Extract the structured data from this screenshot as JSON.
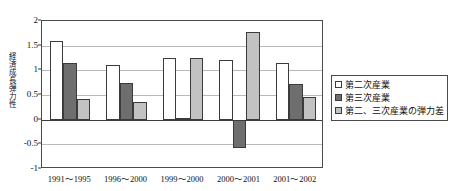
{
  "chart_data": {
    "type": "bar",
    "title": "",
    "xlabel": "",
    "ylabel": "経済成長弾力性",
    "categories": [
      "1991〜1995",
      "1996〜2000",
      "1999〜2000",
      "2000〜2001",
      "2001〜2002"
    ],
    "series": [
      {
        "name": "第二次産業",
        "color": "#ffffff",
        "values": [
          1.6,
          1.1,
          1.25,
          1.2,
          1.15
        ]
      },
      {
        "name": "第三次産業",
        "color": "#6e6e6e",
        "values": [
          1.15,
          0.75,
          0.03,
          -0.57,
          0.72
        ]
      },
      {
        "name": "第二、三次産業の弾力差",
        "color": "#c2c2c2",
        "values": [
          0.42,
          0.35,
          1.25,
          1.78,
          0.45
        ]
      }
    ],
    "ylim": [
      -1,
      2
    ],
    "yticks": [
      2,
      1.5,
      1,
      0.5,
      0,
      -0.5,
      -1
    ],
    "ytick_labels": [
      "2",
      "1.5",
      "1",
      "0.5",
      "0",
      "-0.5",
      "-1"
    ],
    "grid": true,
    "legend_position": "right"
  }
}
